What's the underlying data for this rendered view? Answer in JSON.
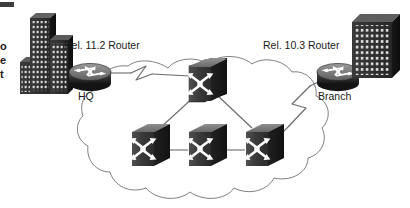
{
  "diagram": {
    "type": "network-topology",
    "background_color": "#ffffff",
    "line_color": "#6b6b6b",
    "node_dark_color": "#262626",
    "node_mid_color": "#4a4a4a",
    "node_light_color": "#8a8a8a",
    "text_color": "#1a1a1a"
  },
  "labels": {
    "hq_router_release": "Rel. 11.2 Router",
    "hq_site": "HQ",
    "branch_router_release": "Rel. 10.3 Router",
    "branch_site": "Branch"
  },
  "edge_text_fragments": [
    {
      "id": "frag-o",
      "text": "o"
    },
    {
      "id": "frag-e",
      "text": "e"
    },
    {
      "id": "frag-t",
      "text": "t"
    }
  ],
  "nodes": [
    {
      "id": "hq-building",
      "kind": "building",
      "label": "",
      "x": 38,
      "y": 48
    },
    {
      "id": "hq-router",
      "kind": "router",
      "label": "HQ",
      "x": 88,
      "y": 72
    },
    {
      "id": "cloud",
      "kind": "wan-cloud",
      "label": "",
      "x": 205,
      "y": 130
    },
    {
      "id": "switch-top",
      "kind": "switch",
      "label": "",
      "x": 205,
      "y": 80
    },
    {
      "id": "switch-left",
      "kind": "switch",
      "label": "",
      "x": 148,
      "y": 145
    },
    {
      "id": "switch-center",
      "kind": "switch",
      "label": "",
      "x": 205,
      "y": 145
    },
    {
      "id": "switch-right",
      "kind": "switch",
      "label": "",
      "x": 262,
      "y": 145
    },
    {
      "id": "branch-router",
      "kind": "router",
      "label": "Branch",
      "x": 338,
      "y": 72
    },
    {
      "id": "branch-building",
      "kind": "building",
      "label": "",
      "x": 375,
      "y": 45
    }
  ],
  "links": [
    {
      "id": "link-hq-to-cloud",
      "from": "hq-router",
      "to": "switch-top",
      "style": "serial-zigzag"
    },
    {
      "id": "link-cloud-to-branch",
      "from": "switch-right",
      "to": "branch-router",
      "style": "serial-zigzag"
    },
    {
      "id": "link-top-to-left",
      "from": "switch-top",
      "to": "switch-left",
      "style": "solid"
    },
    {
      "id": "link-top-to-right",
      "from": "switch-top",
      "to": "switch-right",
      "style": "solid"
    },
    {
      "id": "link-left-to-center",
      "from": "switch-left",
      "to": "switch-center",
      "style": "solid"
    },
    {
      "id": "link-center-to-right",
      "from": "switch-center",
      "to": "switch-right",
      "style": "solid"
    },
    {
      "id": "link-hqbldg-to-router",
      "from": "hq-building",
      "to": "hq-router",
      "style": "solid"
    },
    {
      "id": "link-branchbldg-router",
      "from": "branch-building",
      "to": "branch-router",
      "style": "solid"
    }
  ]
}
